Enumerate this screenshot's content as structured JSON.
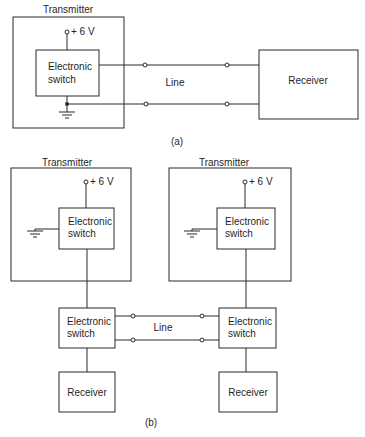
{
  "diagram_a": {
    "transmitter_label": "Transmitter",
    "supply_label": "+ 6 V",
    "switch_line1": "Electronic",
    "switch_line2": "switch",
    "line_label": "Line",
    "receiver_label": "Receiver",
    "caption": "(a)"
  },
  "diagram_b": {
    "left": {
      "transmitter_label": "Transmitter",
      "supply_label": "+ 6 V",
      "tx_switch_line1": "Electronic",
      "tx_switch_line2": "switch",
      "rx_switch_line1": "Electronic",
      "rx_switch_line2": "switch",
      "receiver_label": "Receiver"
    },
    "right": {
      "transmitter_label": "Transmitter",
      "supply_label": "+ 6 V",
      "tx_switch_line1": "Electronic",
      "tx_switch_line2": "switch",
      "rx_switch_line1": "Electronic",
      "rx_switch_line2": "switch",
      "receiver_label": "Receiver"
    },
    "line_label": "Line",
    "caption": "(b)"
  }
}
